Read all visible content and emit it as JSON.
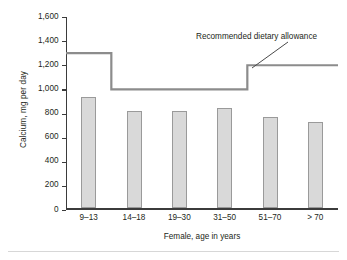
{
  "chart_data": {
    "type": "bar",
    "title": "",
    "xlabel": "Female, age in years",
    "ylabel": "Calcium, mg per day",
    "categories": [
      "9–13",
      "14–18",
      "19–30",
      "31–50",
      "51–70",
      "> 70"
    ],
    "values": [
      920,
      810,
      805,
      835,
      755,
      715
    ],
    "ylim": [
      0,
      1600
    ],
    "yticks": [
      0,
      200,
      400,
      600,
      800,
      1000,
      1200,
      1400,
      1600
    ],
    "ytick_labels": [
      "0",
      "200",
      "400",
      "600",
      "800",
      "1,000",
      "1,200",
      "1,400",
      "1,600"
    ],
    "grid": false,
    "legend": "none",
    "series": [
      {
        "name": "Median calcium intake",
        "type": "bar",
        "values": [
          920,
          810,
          805,
          835,
          755,
          715
        ]
      },
      {
        "name": "Recommended dietary allowance",
        "type": "step",
        "values": [
          1300,
          1000,
          1000,
          1000,
          1200,
          1200
        ]
      }
    ],
    "annotations": [
      {
        "text": "Recommended dietary allowance",
        "target_value": 1200
      }
    ],
    "colors": {
      "bar_fill": "#d9d9d9",
      "bar_border": "#9a9a9a",
      "rda_line": "#8c8c8c",
      "axis": "#3b3b3b",
      "text": "#231f20"
    }
  }
}
